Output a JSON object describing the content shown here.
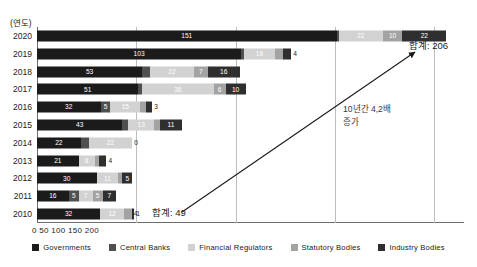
{
  "chart_data": {
    "type": "bar",
    "title": "",
    "subtitle": "",
    "orientation": "horizontal",
    "stacked": true,
    "xlabel": "",
    "ylabel": "(연도)",
    "xlim": [
      0,
      215
    ],
    "ylim": null,
    "grid": true,
    "xticks": [
      0,
      50,
      100,
      150,
      200
    ],
    "xtick_labels": [
      "0",
      "50",
      "100",
      "150",
      "200"
    ],
    "xticks_text": "0 50 100 150 200",
    "categories": [
      "2020",
      "2019",
      "2018",
      "2017",
      "2016",
      "2015",
      "2014",
      "2013",
      "2012",
      "2011",
      "2010"
    ],
    "legend_position": "bottom",
    "series": [
      {
        "name": "Governments",
        "color": "#1b1b1b",
        "values": [
          151,
          103,
          53,
          51,
          32,
          43,
          22,
          21,
          30,
          16,
          32
        ]
      },
      {
        "name": "Central Banks",
        "color": "#4f4f4f",
        "values": [
          1,
          1,
          4,
          2,
          5,
          3,
          4,
          0,
          0,
          5,
          0
        ]
      },
      {
        "name": "Financial Regulators",
        "color": "#d2d2d2",
        "values": [
          22,
          16,
          22,
          36,
          15,
          13,
          22,
          8,
          11,
          7,
          12
        ]
      },
      {
        "name": "Statutory Bodies",
        "color": "#a3a3a3",
        "values": [
          10,
          4,
          7,
          6,
          3,
          3,
          0,
          2,
          2,
          5,
          4
        ]
      },
      {
        "name": "Industry Bodies",
        "color": "#2f2f2f",
        "values": [
          22,
          4,
          16,
          10,
          3,
          11,
          0,
          4,
          5,
          7,
          1
        ]
      }
    ],
    "bar_rows": [
      {
        "year": "2020",
        "segments": [
          {
            "series": "Governments",
            "value": 151,
            "label": "151",
            "swatch": "s0"
          },
          {
            "series": "Central Banks",
            "value": 1,
            "label": "1",
            "swatch": "s1"
          },
          {
            "series": "Financial Regulators",
            "value": 22,
            "label": "22",
            "swatch": "s2"
          },
          {
            "series": "Statutory Bodies",
            "value": 10,
            "label": "10",
            "swatch": "s3"
          },
          {
            "series": "Industry Bodies",
            "value": 22,
            "label": "22",
            "swatch": "s4"
          }
        ]
      },
      {
        "year": "2019",
        "segments": [
          {
            "series": "Governments",
            "value": 103,
            "label": "103",
            "swatch": "s0"
          },
          {
            "series": "Central Banks",
            "value": 1,
            "label": "1",
            "swatch": "s1"
          },
          {
            "series": "Financial Regulators",
            "value": 16,
            "label": "16",
            "swatch": "s2"
          },
          {
            "series": "Statutory Bodies",
            "value": 4,
            "label": "4",
            "swatch": "s3"
          },
          {
            "series": "Industry Bodies",
            "value": 4,
            "label": "4",
            "swatch": "s4"
          }
        ]
      },
      {
        "year": "2018",
        "segments": [
          {
            "series": "Governments",
            "value": 53,
            "label": "53",
            "swatch": "s0"
          },
          {
            "series": "Central Banks",
            "value": 4,
            "label": "4",
            "swatch": "s1"
          },
          {
            "series": "Financial Regulators",
            "value": 22,
            "label": "22",
            "swatch": "s2"
          },
          {
            "series": "Statutory Bodies",
            "value": 7,
            "label": "7",
            "swatch": "s3"
          },
          {
            "series": "Industry Bodies",
            "value": 16,
            "label": "16",
            "swatch": "s4"
          }
        ]
      },
      {
        "year": "2017",
        "segments": [
          {
            "series": "Governments",
            "value": 51,
            "label": "51",
            "swatch": "s0"
          },
          {
            "series": "Central Banks",
            "value": 2,
            "label": "2",
            "swatch": "s1"
          },
          {
            "series": "Financial Regulators",
            "value": 36,
            "label": "36",
            "swatch": "s2"
          },
          {
            "series": "Statutory Bodies",
            "value": 6,
            "label": "6",
            "swatch": "s3"
          },
          {
            "series": "Industry Bodies",
            "value": 10,
            "label": "10",
            "swatch": "s4"
          }
        ]
      },
      {
        "year": "2016",
        "segments": [
          {
            "series": "Governments",
            "value": 32,
            "label": "32",
            "swatch": "s0"
          },
          {
            "series": "Central Banks",
            "value": 5,
            "label": "5",
            "swatch": "s1"
          },
          {
            "series": "Financial Regulators",
            "value": 15,
            "label": "15",
            "swatch": "s2"
          },
          {
            "series": "Statutory Bodies",
            "value": 3,
            "label": "3",
            "swatch": "s3"
          },
          {
            "series": "Industry Bodies",
            "value": 3,
            "label": "3",
            "swatch": "s4"
          }
        ]
      },
      {
        "year": "2015",
        "segments": [
          {
            "series": "Governments",
            "value": 43,
            "label": "43",
            "swatch": "s0"
          },
          {
            "series": "Central Banks",
            "value": 3,
            "label": "3",
            "swatch": "s1"
          },
          {
            "series": "Financial Regulators",
            "value": 13,
            "label": "13",
            "swatch": "s2"
          },
          {
            "series": "Statutory Bodies",
            "value": 3,
            "label": "3",
            "swatch": "s3"
          },
          {
            "series": "Industry Bodies",
            "value": 11,
            "label": "11",
            "swatch": "s4"
          }
        ]
      },
      {
        "year": "2014",
        "segments": [
          {
            "series": "Governments",
            "value": 22,
            "label": "22",
            "swatch": "s0"
          },
          {
            "series": "Central Banks",
            "value": 4,
            "label": "4",
            "swatch": "s1"
          },
          {
            "series": "Financial Regulators",
            "value": 22,
            "label": "22",
            "swatch": "s2"
          },
          {
            "series": "Statutory Bodies",
            "value": 0,
            "label": "0",
            "swatch": "s3"
          }
        ]
      },
      {
        "year": "2013",
        "segments": [
          {
            "series": "Governments",
            "value": 21,
            "label": "21",
            "swatch": "s0"
          },
          {
            "series": "Financial Regulators",
            "value": 8,
            "label": "8",
            "swatch": "s2"
          },
          {
            "series": "Statutory Bodies",
            "value": 2,
            "label": "2",
            "swatch": "s3"
          },
          {
            "series": "Industry Bodies",
            "value": 4,
            "label": "4",
            "swatch": "s4"
          }
        ]
      },
      {
        "year": "2012",
        "segments": [
          {
            "series": "Governments",
            "value": 30,
            "label": "30",
            "swatch": "s0"
          },
          {
            "series": "Financial Regulators",
            "value": 11,
            "label": "11",
            "swatch": "s2"
          },
          {
            "series": "Statutory Bodies",
            "value": 2,
            "label": "2",
            "swatch": "s3"
          },
          {
            "series": "Industry Bodies",
            "value": 5,
            "label": "5",
            "swatch": "s4"
          }
        ]
      },
      {
        "year": "2011",
        "segments": [
          {
            "series": "Governments",
            "value": 16,
            "label": "16",
            "swatch": "s0"
          },
          {
            "series": "Central Banks",
            "value": 5,
            "label": "5",
            "swatch": "s1"
          },
          {
            "series": "Financial Regulators",
            "value": 7,
            "label": "7",
            "swatch": "s2"
          },
          {
            "series": "Statutory Bodies",
            "value": 5,
            "label": "5",
            "swatch": "s3"
          },
          {
            "series": "Industry Bodies",
            "value": 7,
            "label": "7",
            "swatch": "s4"
          }
        ]
      },
      {
        "year": "2010",
        "segments": [
          {
            "series": "Governments",
            "value": 32,
            "label": "32",
            "swatch": "s0"
          },
          {
            "series": "Financial Regulators",
            "value": 12,
            "label": "12",
            "swatch": "s2"
          },
          {
            "series": "Statutory Bodies",
            "value": 4,
            "label": "4",
            "swatch": "s3"
          },
          {
            "series": "Industry Bodies",
            "value": 1,
            "label": "1",
            "swatch": "s4"
          }
        ]
      }
    ],
    "annotations": [
      {
        "id": "total-top",
        "text": "합계: 206",
        "target_year": "2020",
        "value": 206
      },
      {
        "id": "total-bottom",
        "text": "합계: 49",
        "target_year": "2010",
        "value": 49
      },
      {
        "id": "growth",
        "line1": "10년간 4,2배",
        "line2": "증가"
      }
    ]
  }
}
